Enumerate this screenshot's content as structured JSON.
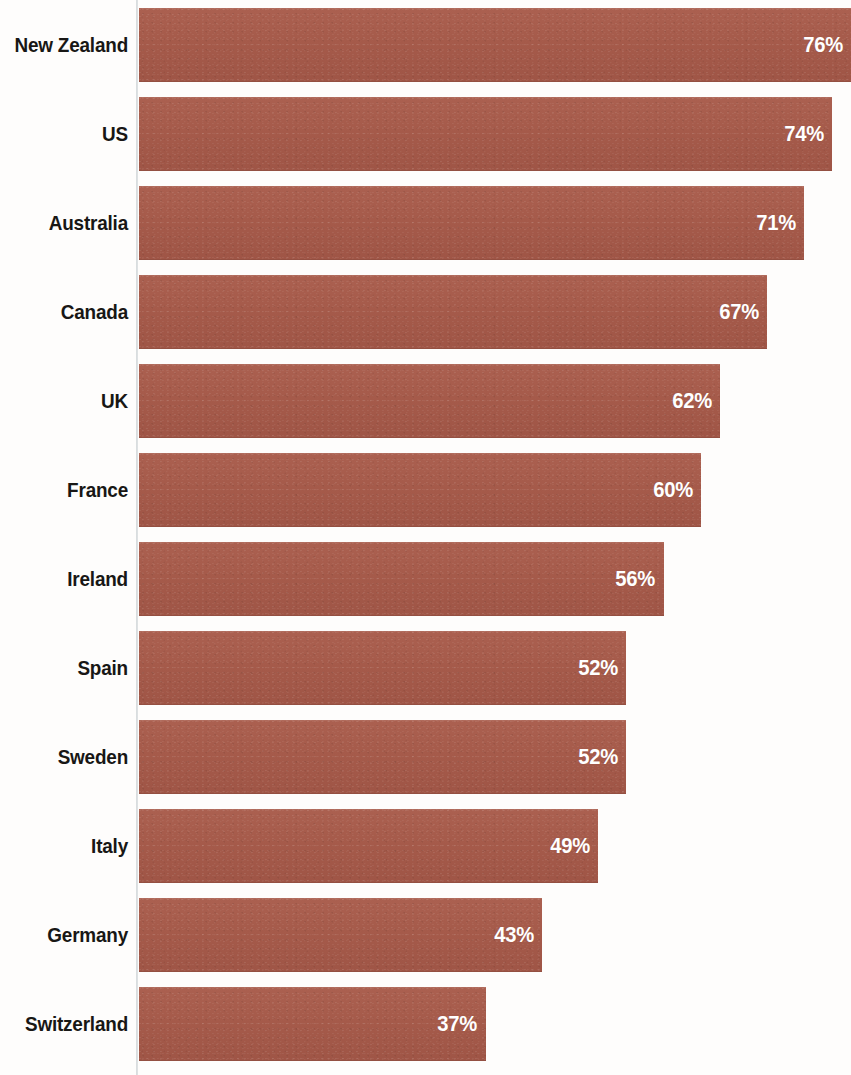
{
  "chart_data": {
    "type": "bar",
    "orientation": "horizontal",
    "title": "",
    "subtitle": "",
    "xlabel": "",
    "ylabel": "",
    "xlim": [
      0,
      76
    ],
    "grid": false,
    "legend": null,
    "value_suffix": "%",
    "categories": [
      "New Zealand",
      "US",
      "Australia",
      "Canada",
      "UK",
      "France",
      "Ireland",
      "Spain",
      "Sweden",
      "Italy",
      "Germany",
      "Switzerland"
    ],
    "values": [
      76,
      74,
      71,
      67,
      62,
      60,
      56,
      52,
      52,
      49,
      43,
      37
    ],
    "value_labels": [
      "76%",
      "74%",
      "71%",
      "67%",
      "62%",
      "60%",
      "56%",
      "52%",
      "52%",
      "49%",
      "43%",
      "37%"
    ],
    "bars": [
      {
        "label": "New Zealand",
        "value": 76,
        "value_label": "76%"
      },
      {
        "label": "US",
        "value": 74,
        "value_label": "74%"
      },
      {
        "label": "Australia",
        "value": 71,
        "value_label": "71%"
      },
      {
        "label": "Canada",
        "value": 67,
        "value_label": "67%"
      },
      {
        "label": "UK",
        "value": 62,
        "value_label": "62%"
      },
      {
        "label": "France",
        "value": 60,
        "value_label": "60%"
      },
      {
        "label": "Ireland",
        "value": 56,
        "value_label": "56%"
      },
      {
        "label": "Spain",
        "value": 52,
        "value_label": "52%"
      },
      {
        "label": "Sweden",
        "value": 52,
        "value_label": "52%"
      },
      {
        "label": "Italy",
        "value": 49,
        "value_label": "49%"
      },
      {
        "label": "Germany",
        "value": 43,
        "value_label": "43%"
      },
      {
        "label": "Switzerland",
        "value": 37,
        "value_label": "37%"
      }
    ],
    "colors": {
      "bar": "#a65b4b",
      "value_label": "#ffffff",
      "category_label": "#181715",
      "axis_line": "#bcc4c8",
      "background": "#fefdfc"
    }
  }
}
